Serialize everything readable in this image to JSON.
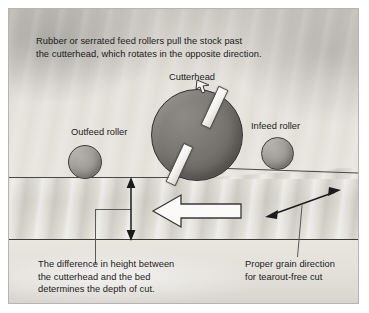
{
  "figure": {
    "type": "technical-illustration",
    "background_color": "#ded B",
    "border_color": "#b8b5b0"
  },
  "captions": {
    "top": "Rubber or serrated feed rollers pull the stock past\nthe cutterhead, which rotates in the opposite direction.",
    "depth_of_cut": "The difference in height between\nthe cutterhead and the bed\ndetermines the depth of cut.",
    "grain_direction": "Proper grain direction\nfor tearout-free cut"
  },
  "labels": {
    "cutterhead": "Cutterhead",
    "outfeed_roller": "Outfeed roller",
    "infeed_roller": "Infeed roller"
  },
  "parts": {
    "cutterhead": {
      "name": "cutterhead",
      "shape": "circle",
      "fill": "#7a7772",
      "outline": "#34322f",
      "knives": 2,
      "knife_color": "#ffffff"
    },
    "outfeed_roller": {
      "name": "outfeed-roller",
      "shape": "circle",
      "fill": "#a09d98",
      "outline": "#3f3d3a"
    },
    "infeed_roller": {
      "name": "infeed-roller",
      "shape": "circle",
      "fill": "#a09d98",
      "outline": "#3f3d3a"
    },
    "workpiece": {
      "name": "stock-board",
      "fill": "#e0ddd7",
      "texture": "wood-grain"
    },
    "bed": {
      "name": "planer-bed",
      "fill": "#e6e3dd"
    }
  },
  "arrows": {
    "feed_direction": {
      "name": "feed-direction-arrow",
      "points": "left",
      "style": "hollow-white-outlined",
      "fill": "#fbfaf8",
      "outline": "#3a3835"
    },
    "depth_of_cut": {
      "name": "depth-of-cut-arrow",
      "style": "double-headed-vertical",
      "color": "#1b1b1b"
    },
    "grain_direction": {
      "name": "grain-direction-arrow",
      "style": "double-headed-diagonal",
      "color": "#1b1b1b"
    }
  }
}
